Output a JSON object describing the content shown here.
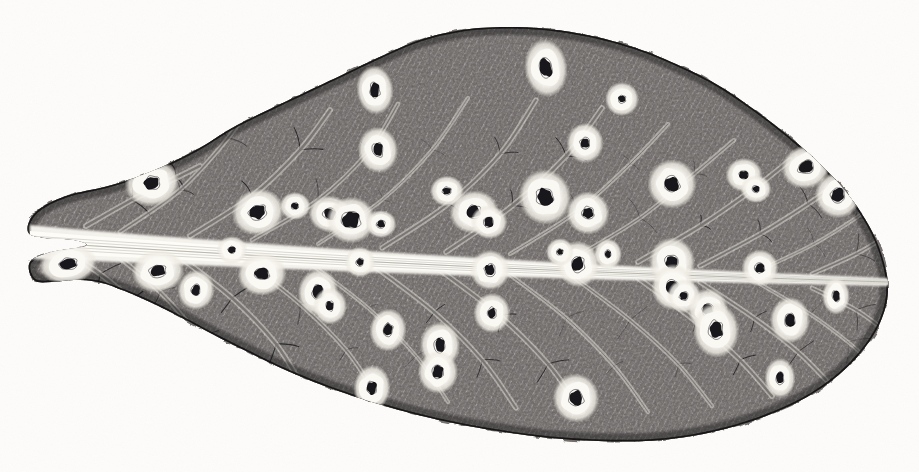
{
  "image": {
    "domain": "Natural-Image",
    "kind": "botanical-engraving",
    "subject": "leaf with fungal leaf-spot lesions",
    "medium": "pen-and-ink stipple / crosshatch engraving on aged paper",
    "width": 919,
    "height": 472,
    "caption": "",
    "has_text": false
  },
  "palette": {
    "paper": "#fdfcfa",
    "paper_speckle": "#ece8e0",
    "ink_dark": "#17161a",
    "ink_mid": "#4a474b",
    "ink_light": "#8d8a8c",
    "lamina_base": "#6f6b6a",
    "vein_line": "#141316",
    "midrib_white": "#fbfaf6",
    "halo_white": "#f7f5ef",
    "lesion_core": "#121114"
  },
  "leaf": {
    "name": "leaf-blade",
    "orientation": "horizontal, base at left, apex at right",
    "outline_points": [
      [
        28,
        232
      ],
      [
        36,
        212
      ],
      [
        66,
        196
      ],
      [
        108,
        186
      ],
      [
        150,
        172
      ],
      [
        196,
        150
      ],
      [
        232,
        128
      ],
      [
        268,
        110
      ],
      [
        306,
        92
      ],
      [
        344,
        74
      ],
      [
        382,
        56
      ],
      [
        420,
        40
      ],
      [
        462,
        30
      ],
      [
        506,
        27
      ],
      [
        548,
        29
      ],
      [
        592,
        36
      ],
      [
        636,
        48
      ],
      [
        676,
        64
      ],
      [
        716,
        84
      ],
      [
        752,
        108
      ],
      [
        786,
        134
      ],
      [
        818,
        162
      ],
      [
        846,
        192
      ],
      [
        868,
        224
      ],
      [
        882,
        256
      ],
      [
        888,
        288
      ],
      [
        882,
        318
      ],
      [
        866,
        346
      ],
      [
        842,
        372
      ],
      [
        812,
        394
      ],
      [
        776,
        412
      ],
      [
        736,
        426
      ],
      [
        692,
        436
      ],
      [
        646,
        441
      ],
      [
        598,
        441
      ],
      [
        550,
        438
      ],
      [
        504,
        432
      ],
      [
        458,
        424
      ],
      [
        414,
        414
      ],
      [
        372,
        402
      ],
      [
        330,
        388
      ],
      [
        290,
        372
      ],
      [
        252,
        354
      ],
      [
        216,
        336
      ],
      [
        182,
        318
      ],
      [
        150,
        302
      ],
      [
        122,
        290
      ],
      [
        98,
        282
      ],
      [
        74,
        280
      ],
      [
        52,
        282
      ],
      [
        34,
        280
      ],
      [
        30,
        262
      ],
      [
        52,
        252
      ],
      [
        86,
        246
      ],
      [
        74,
        240
      ],
      [
        46,
        238
      ]
    ],
    "midrib": {
      "name": "midrib",
      "color": "#fbfaf6",
      "from": [
        30,
        242
      ],
      "to": [
        888,
        282
      ],
      "thickness_left": 22,
      "thickness_right": 5
    },
    "lateral_vein_count": 26,
    "lesion_count": 48
  },
  "lesions": {
    "description": "pale-haloed dark-centred spots arranged along the secondary veins on both halves of the blade",
    "upper_half": [
      {
        "cx": 152,
        "cy": 183,
        "rx": 18,
        "ry": 15,
        "crx": 7.5,
        "cry": 6.0,
        "rot": -12
      },
      {
        "cx": 258,
        "cy": 212,
        "rx": 17,
        "ry": 15,
        "crx": 8.0,
        "cry": 6.5,
        "rot": -18
      },
      {
        "cx": 330,
        "cy": 214,
        "rx": 14,
        "ry": 12,
        "crx": 6.0,
        "cry": 5.0,
        "rot": 8
      },
      {
        "cx": 351,
        "cy": 220,
        "rx": 16,
        "ry": 15,
        "crx": 9.0,
        "cry": 8.0,
        "rot": -5
      },
      {
        "cx": 375,
        "cy": 90,
        "rx": 12,
        "ry": 16,
        "crx": 4.5,
        "cry": 7.0,
        "rot": -6
      },
      {
        "cx": 378,
        "cy": 150,
        "rx": 13,
        "ry": 15,
        "crx": 5.0,
        "cry": 6.5,
        "rot": -8
      },
      {
        "cx": 381,
        "cy": 224,
        "rx": 10,
        "ry": 9,
        "crx": 4.0,
        "cry": 3.5,
        "rot": 0
      },
      {
        "cx": 474,
        "cy": 212,
        "rx": 16,
        "ry": 14,
        "crx": 6.5,
        "cry": 6.0,
        "rot": -10
      },
      {
        "cx": 489,
        "cy": 222,
        "rx": 12,
        "ry": 11,
        "crx": 4.5,
        "cry": 4.5,
        "rot": 6
      },
      {
        "cx": 546,
        "cy": 68,
        "rx": 14,
        "ry": 19,
        "crx": 6.0,
        "cry": 9.0,
        "rot": -7
      },
      {
        "cx": 545,
        "cy": 197,
        "rx": 17,
        "ry": 18,
        "crx": 8.0,
        "cry": 8.5,
        "rot": -14
      },
      {
        "cx": 585,
        "cy": 143,
        "rx": 12,
        "ry": 13,
        "crx": 4.5,
        "cry": 5.0,
        "rot": 0
      },
      {
        "cx": 588,
        "cy": 213,
        "rx": 14,
        "ry": 14,
        "crx": 5.5,
        "cry": 5.5,
        "rot": -8
      },
      {
        "cx": 622,
        "cy": 99,
        "rx": 11,
        "ry": 11,
        "crx": 3.5,
        "cry": 3.5,
        "rot": 0
      },
      {
        "cx": 672,
        "cy": 184,
        "rx": 16,
        "ry": 16,
        "crx": 7.0,
        "cry": 7.0,
        "rot": -12
      },
      {
        "cx": 744,
        "cy": 175,
        "rx": 12,
        "ry": 11,
        "crx": 4.5,
        "cry": 4.0,
        "rot": 0
      },
      {
        "cx": 756,
        "cy": 189,
        "rx": 10,
        "ry": 9,
        "crx": 3.5,
        "cry": 3.0,
        "rot": 0
      },
      {
        "cx": 806,
        "cy": 167,
        "rx": 16,
        "ry": 14,
        "crx": 7.5,
        "cry": 6.0,
        "rot": -15
      },
      {
        "cx": 838,
        "cy": 195,
        "rx": 15,
        "ry": 15,
        "crx": 6.5,
        "cry": 6.5,
        "rot": -10
      },
      {
        "cx": 447,
        "cy": 191,
        "rx": 11,
        "ry": 10,
        "crx": 4.0,
        "cry": 3.5,
        "rot": 0
      },
      {
        "cx": 295,
        "cy": 206,
        "rx": 10,
        "ry": 9,
        "crx": 3.5,
        "cry": 3.0,
        "rot": 0
      }
    ],
    "lower_half": [
      {
        "cx": 68,
        "cy": 264,
        "rx": 19,
        "ry": 13,
        "crx": 9.0,
        "cry": 5.0,
        "rot": -8
      },
      {
        "cx": 158,
        "cy": 271,
        "rx": 17,
        "ry": 14,
        "crx": 7.5,
        "cry": 5.5,
        "rot": -6
      },
      {
        "cx": 196,
        "cy": 290,
        "rx": 12,
        "ry": 13,
        "crx": 4.0,
        "cry": 5.0,
        "rot": 10
      },
      {
        "cx": 262,
        "cy": 274,
        "rx": 16,
        "ry": 14,
        "crx": 7.0,
        "cry": 5.5,
        "rot": -6
      },
      {
        "cx": 318,
        "cy": 292,
        "rx": 13,
        "ry": 15,
        "crx": 5.0,
        "cry": 6.5,
        "rot": 8
      },
      {
        "cx": 330,
        "cy": 306,
        "rx": 11,
        "ry": 12,
        "crx": 3.5,
        "cry": 4.5,
        "rot": 0
      },
      {
        "cx": 360,
        "cy": 262,
        "rx": 10,
        "ry": 10,
        "crx": 3.5,
        "cry": 3.5,
        "rot": 0
      },
      {
        "cx": 388,
        "cy": 330,
        "rx": 12,
        "ry": 14,
        "crx": 4.5,
        "cry": 6.0,
        "rot": 6
      },
      {
        "cx": 440,
        "cy": 345,
        "rx": 13,
        "ry": 15,
        "crx": 5.0,
        "cry": 6.5,
        "rot": -4
      },
      {
        "cx": 438,
        "cy": 372,
        "rx": 13,
        "ry": 14,
        "crx": 5.5,
        "cry": 6.0,
        "rot": 0
      },
      {
        "cx": 372,
        "cy": 388,
        "rx": 12,
        "ry": 15,
        "crx": 4.5,
        "cry": 6.5,
        "rot": 4
      },
      {
        "cx": 490,
        "cy": 270,
        "rx": 13,
        "ry": 13,
        "crx": 5.0,
        "cry": 5.5,
        "rot": 0
      },
      {
        "cx": 492,
        "cy": 313,
        "rx": 12,
        "ry": 13,
        "crx": 4.0,
        "cry": 5.0,
        "rot": 0
      },
      {
        "cx": 578,
        "cy": 264,
        "rx": 14,
        "ry": 15,
        "crx": 6.0,
        "cry": 7.0,
        "rot": -6
      },
      {
        "cx": 576,
        "cy": 398,
        "rx": 15,
        "ry": 16,
        "crx": 7.0,
        "cry": 7.0,
        "rot": -8
      },
      {
        "cx": 672,
        "cy": 262,
        "rx": 15,
        "ry": 16,
        "crx": 6.5,
        "cry": 6.5,
        "rot": 0
      },
      {
        "cx": 673,
        "cy": 287,
        "rx": 14,
        "ry": 15,
        "crx": 6.0,
        "cry": 6.5,
        "rot": 0
      },
      {
        "cx": 684,
        "cy": 296,
        "rx": 11,
        "ry": 11,
        "crx": 4.0,
        "cry": 4.0,
        "rot": 0
      },
      {
        "cx": 708,
        "cy": 310,
        "rx": 13,
        "ry": 14,
        "crx": 5.0,
        "cry": 6.0,
        "rot": 0
      },
      {
        "cx": 716,
        "cy": 330,
        "rx": 15,
        "ry": 18,
        "crx": 6.5,
        "cry": 8.5,
        "rot": -5
      },
      {
        "cx": 790,
        "cy": 320,
        "rx": 13,
        "ry": 15,
        "crx": 5.0,
        "cry": 6.0,
        "rot": 0
      },
      {
        "cx": 760,
        "cy": 268,
        "rx": 12,
        "ry": 12,
        "crx": 4.5,
        "cry": 4.5,
        "rot": 0
      },
      {
        "cx": 836,
        "cy": 296,
        "rx": 9,
        "ry": 12,
        "crx": 3.5,
        "cry": 5.0,
        "rot": 0
      },
      {
        "cx": 780,
        "cy": 378,
        "rx": 10,
        "ry": 13,
        "crx": 3.5,
        "cry": 5.5,
        "rot": 0
      },
      {
        "cx": 232,
        "cy": 250,
        "rx": 10,
        "ry": 9,
        "crx": 3.5,
        "cry": 3.0,
        "rot": 0
      },
      {
        "cx": 560,
        "cy": 252,
        "rx": 9,
        "ry": 9,
        "crx": 3.0,
        "cry": 3.0,
        "rot": 0
      },
      {
        "cx": 608,
        "cy": 254,
        "rx": 9,
        "ry": 10,
        "crx": 3.0,
        "cry": 3.5,
        "rot": 0
      }
    ]
  },
  "veins": {
    "upper": [
      [
        [
          120,
          232
        ],
        [
          180,
          190
        ],
        [
          228,
          138
        ],
        [
          250,
          104
        ]
      ],
      [
        [
          190,
          236
        ],
        [
          252,
          196
        ],
        [
          300,
          150
        ],
        [
          330,
          110
        ]
      ],
      [
        [
          252,
          240
        ],
        [
          318,
          200
        ],
        [
          368,
          152
        ],
        [
          398,
          104
        ]
      ],
      [
        [
          318,
          244
        ],
        [
          382,
          200
        ],
        [
          432,
          150
        ],
        [
          468,
          98
        ]
      ],
      [
        [
          382,
          248
        ],
        [
          448,
          204
        ],
        [
          500,
          154
        ],
        [
          536,
          100
        ]
      ],
      [
        [
          446,
          252
        ],
        [
          512,
          206
        ],
        [
          566,
          156
        ],
        [
          602,
          108
        ]
      ],
      [
        [
          510,
          254
        ],
        [
          576,
          212
        ],
        [
          630,
          164
        ],
        [
          668,
          124
        ]
      ],
      [
        [
          574,
          258
        ],
        [
          640,
          218
        ],
        [
          694,
          174
        ],
        [
          734,
          140
        ]
      ],
      [
        [
          638,
          262
        ],
        [
          700,
          226
        ],
        [
          752,
          190
        ],
        [
          790,
          160
        ]
      ],
      [
        [
          700,
          266
        ],
        [
          760,
          234
        ],
        [
          808,
          204
        ],
        [
          842,
          180
        ]
      ],
      [
        [
          760,
          270
        ],
        [
          814,
          244
        ],
        [
          856,
          218
        ],
        [
          880,
          200
        ]
      ],
      [
        [
          812,
          274
        ],
        [
          856,
          254
        ],
        [
          886,
          236
        ],
        [
          898,
          226
        ]
      ],
      [
        [
          86,
          226
        ],
        [
          132,
          200
        ],
        [
          176,
          178
        ],
        [
          200,
          166
        ]
      ]
    ],
    "lower": [
      [
        [
          110,
          250
        ],
        [
          160,
          292
        ],
        [
          200,
          338
        ],
        [
          222,
          374
        ]
      ],
      [
        [
          176,
          254
        ],
        [
          232,
          298
        ],
        [
          276,
          344
        ],
        [
          302,
          386
        ]
      ],
      [
        [
          242,
          258
        ],
        [
          300,
          304
        ],
        [
          346,
          350
        ],
        [
          376,
          394
        ]
      ],
      [
        [
          308,
          262
        ],
        [
          368,
          308
        ],
        [
          416,
          356
        ],
        [
          448,
          402
        ]
      ],
      [
        [
          374,
          266
        ],
        [
          434,
          312
        ],
        [
          482,
          360
        ],
        [
          516,
          408
        ]
      ],
      [
        [
          440,
          270
        ],
        [
          500,
          316
        ],
        [
          548,
          364
        ],
        [
          582,
          412
        ]
      ],
      [
        [
          506,
          272
        ],
        [
          566,
          318
        ],
        [
          614,
          366
        ],
        [
          648,
          412
        ]
      ],
      [
        [
          572,
          276
        ],
        [
          630,
          320
        ],
        [
          678,
          364
        ],
        [
          712,
          406
        ]
      ],
      [
        [
          638,
          278
        ],
        [
          694,
          320
        ],
        [
          740,
          360
        ],
        [
          772,
          396
        ]
      ],
      [
        [
          700,
          282
        ],
        [
          754,
          318
        ],
        [
          798,
          352
        ],
        [
          826,
          380
        ]
      ],
      [
        [
          760,
          284
        ],
        [
          810,
          314
        ],
        [
          848,
          342
        ],
        [
          870,
          362
        ]
      ],
      [
        [
          812,
          288
        ],
        [
          856,
          310
        ],
        [
          884,
          330
        ],
        [
          896,
          340
        ]
      ],
      [
        [
          62,
          248
        ],
        [
          100,
          274
        ],
        [
          132,
          300
        ],
        [
          150,
          316
        ]
      ]
    ]
  }
}
